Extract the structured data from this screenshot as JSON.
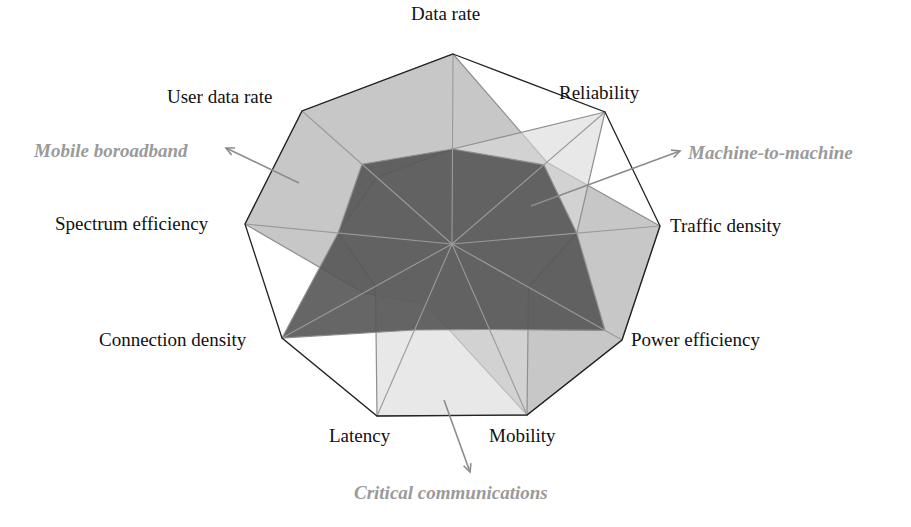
{
  "chart_data": {
    "type": "radar",
    "title": "",
    "center": [
      452,
      244
    ],
    "axes": [
      {
        "name": "Data rate",
        "vertex": [
          453,
          54
        ]
      },
      {
        "name": "Reliability",
        "vertex": [
          605,
          112
        ]
      },
      {
        "name": "Traffic density",
        "vertex": [
          660,
          226
        ]
      },
      {
        "name": "Power efficiency",
        "vertex": [
          622,
          340
        ]
      },
      {
        "name": "Mobility",
        "vertex": [
          527,
          415
        ]
      },
      {
        "name": "Latency",
        "vertex": [
          377,
          416
        ]
      },
      {
        "name": "Connection density",
        "vertex": [
          282,
          338
        ]
      },
      {
        "name": "Spectrum efficiency",
        "vertex": [
          245,
          224
        ]
      },
      {
        "name": "User data rate",
        "vertex": [
          302,
          111
        ]
      }
    ],
    "scale": [
      0,
      1
    ],
    "series": [
      {
        "name": "Mobile boroadband",
        "values": [
          1.0,
          0.62,
          1.0,
          1.0,
          1.0,
          0.35,
          0.52,
          1.0,
          1.0
        ],
        "fill": "#b4b4b4",
        "opacity": 0.75
      },
      {
        "name": "Critical communications",
        "values": [
          0.5,
          1.0,
          0.6,
          0.45,
          1.0,
          1.0,
          0.45,
          0.55,
          0.5
        ],
        "fill": "#d8d8d8",
        "opacity": 0.6
      },
      {
        "name": "Machine-to-machine",
        "values": [
          0.5,
          0.6,
          0.6,
          0.9,
          0.5,
          0.5,
          1.0,
          0.55,
          0.6
        ],
        "fill": "#555555",
        "opacity": 0.9
      }
    ],
    "grid": "outer polygon + spokes",
    "legend": "annotations with arrows"
  },
  "labels": {
    "axes": [
      {
        "text": "Data rate",
        "x": 411,
        "y": 4
      },
      {
        "text": "Reliability",
        "x": 559,
        "y": 83
      },
      {
        "text": "Traffic density",
        "x": 670,
        "y": 216
      },
      {
        "text": "Power efficiency",
        "x": 631,
        "y": 330
      },
      {
        "text": "Mobility",
        "x": 489,
        "y": 426
      },
      {
        "text": "Latency",
        "x": 329,
        "y": 426
      },
      {
        "text": "Connection density",
        "x": 99,
        "y": 330
      },
      {
        "text": "Spectrum efficiency",
        "x": 55,
        "y": 214
      },
      {
        "text": "User data rate",
        "x": 167,
        "y": 87
      }
    ],
    "usage": [
      {
        "text": "Mobile boroadband",
        "x": 34,
        "y": 141,
        "arrow": [
          [
            299,
            183
          ],
          [
            226,
            148
          ]
        ]
      },
      {
        "text": "Machine-to-machine",
        "x": 688,
        "y": 143,
        "arrow": [
          [
            531,
            206
          ],
          [
            680,
            151
          ]
        ]
      },
      {
        "text": "Critical communications",
        "x": 354,
        "y": 483,
        "arrow": [
          [
            444,
            400
          ],
          [
            470,
            472
          ]
        ]
      }
    ]
  },
  "colors": {
    "frame": "#222222",
    "spoke": "#9a9a9a",
    "annotation": "#9a9a9a",
    "arrow": "#8c8c8c"
  }
}
